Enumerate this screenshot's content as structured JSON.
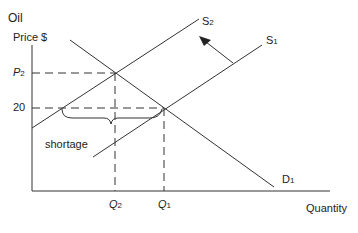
{
  "diagram": {
    "y_axis_title_line1": "Oil",
    "y_axis_title_line2": "Price $",
    "x_axis_title": "Quantity",
    "price_labels": {
      "p2_main": "P",
      "p2_sub": "2",
      "p20": "20"
    },
    "quantity_labels": {
      "q2_main": "Q",
      "q2_sub": "2",
      "q1_main": "Q",
      "q1_sub": "1"
    },
    "curves": {
      "s2_main": "S",
      "s2_sub": "2",
      "s1_main": "S",
      "s1_sub": "1",
      "d1_main": "D",
      "d1_sub": "1"
    },
    "annotation": "shortage",
    "colors": {
      "line": "#333333",
      "background": "#ffffff"
    }
  }
}
